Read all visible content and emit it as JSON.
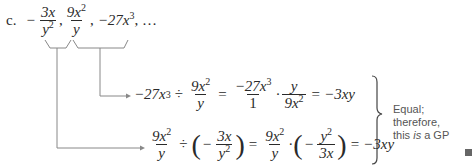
{
  "problem": {
    "label": "c.",
    "sequence": {
      "term1": {
        "sign": "−",
        "num": "3x",
        "den_base": "y",
        "den_exp": "2"
      },
      "term2": {
        "num_coef": "9x",
        "num_exp": "2",
        "den": "y"
      },
      "term3": {
        "text": "−27x",
        "exp": "3"
      },
      "ellipsis": ", …"
    }
  },
  "step1": {
    "lhs": "−27x",
    "lhs_exp": "3",
    "div": "÷",
    "frac1_num": "9x",
    "frac1_num_exp": "2",
    "frac1_den": "y",
    "eq1": "=",
    "frac2_num": "−27x",
    "frac2_num_exp": "3",
    "frac2_den": "1",
    "dot": "·",
    "frac3_num": "y",
    "frac3_den": "9x",
    "frac3_den_exp": "2",
    "eq2": "=",
    "result": "−3xy"
  },
  "step2": {
    "frac1_num": "9x",
    "frac1_num_exp": "2",
    "frac1_den": "y",
    "div": "÷",
    "neg": "−",
    "frac2_num": "3x",
    "frac2_den": "y",
    "frac2_den_exp": "2",
    "eq1": "=",
    "frac3_num": "9x",
    "frac3_num_exp": "2",
    "frac3_den": "y",
    "dot": "·",
    "neg2": "−",
    "frac4_num": "y",
    "frac4_num_exp": "2",
    "frac4_den": "3x",
    "eq2": "=",
    "result": "−3xy"
  },
  "conclusion": {
    "line1": "Equal; therefore,",
    "line2_pre": "this ",
    "line2_em": "is",
    "line2_post": " a GP"
  }
}
